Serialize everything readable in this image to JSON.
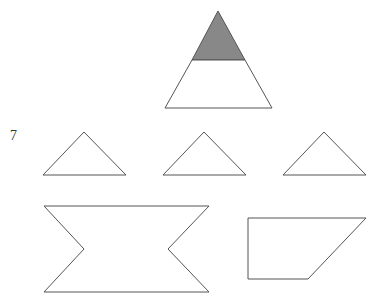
{
  "question_number": "7",
  "colors": {
    "stroke": "#555555",
    "shaded_fill": "#888888",
    "background": "#ffffff"
  },
  "figures": {
    "main_triangle": {
      "shaded_top": [
        [
          218,
          11
        ],
        [
          192,
          60
        ],
        [
          245,
          60
        ]
      ],
      "unshaded_bottom": [
        [
          192,
          60
        ],
        [
          245,
          60
        ],
        [
          272,
          108
        ],
        [
          165,
          108
        ]
      ]
    },
    "triangles": [
      [
        [
          84,
          132
        ],
        [
          43,
          175
        ],
        [
          126,
          175
        ]
      ],
      [
        [
          204,
          132
        ],
        [
          163,
          175
        ],
        [
          246,
          175
        ]
      ],
      [
        [
          324,
          132
        ],
        [
          283,
          175
        ],
        [
          366,
          175
        ]
      ]
    ],
    "bowtie": [
      [
        44,
        206
      ],
      [
        209,
        206
      ],
      [
        168,
        249
      ],
      [
        209,
        292
      ],
      [
        44,
        292
      ],
      [
        84,
        249
      ]
    ],
    "trapezoid": [
      [
        248,
        218
      ],
      [
        366,
        218
      ],
      [
        308,
        279
      ],
      [
        248,
        279
      ]
    ]
  }
}
